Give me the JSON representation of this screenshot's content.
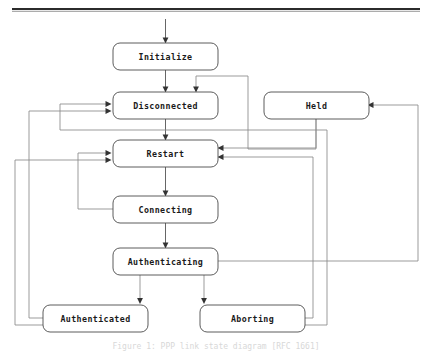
{
  "page": {
    "caption": "Figure 1: PPP link state diagram [RFC 1661]",
    "background_color": "#ffffff",
    "node_fill": "#ffffff",
    "node_stroke": "#4a4a4a",
    "edge_color": "#8a8a8a",
    "arrow_color": "#333333",
    "rule_color": "#2b2b2b"
  },
  "diagram": {
    "type": "state-machine",
    "orientation": "top-down",
    "entry_point": "Initialize",
    "states": [
      {
        "id": "initialize",
        "label": "Initialize",
        "x": 113,
        "y": 43,
        "w": 105,
        "h": 27
      },
      {
        "id": "disconnected",
        "label": "Disconnected",
        "x": 113,
        "y": 92,
        "w": 105,
        "h": 27
      },
      {
        "id": "held",
        "label": "Held",
        "x": 264,
        "y": 92,
        "w": 105,
        "h": 27
      },
      {
        "id": "restart",
        "label": "Restart",
        "x": 113,
        "y": 140,
        "w": 105,
        "h": 27
      },
      {
        "id": "connecting",
        "label": "Connecting",
        "x": 113,
        "y": 196,
        "w": 105,
        "h": 27
      },
      {
        "id": "authenticating",
        "label": "Authenticating",
        "x": 113,
        "y": 248,
        "w": 105,
        "h": 27
      },
      {
        "id": "authenticated",
        "label": "Authenticated",
        "x": 43,
        "y": 305,
        "w": 105,
        "h": 27
      },
      {
        "id": "aborting",
        "label": "Aborting",
        "x": 200,
        "y": 305,
        "w": 105,
        "h": 27
      }
    ],
    "transitions": [
      {
        "from": "start",
        "to": "initialize"
      },
      {
        "from": "initialize",
        "to": "disconnected"
      },
      {
        "from": "disconnected",
        "to": "restart"
      },
      {
        "from": "restart",
        "to": "connecting"
      },
      {
        "from": "connecting",
        "to": "authenticating"
      },
      {
        "from": "authenticating",
        "to": "authenticated"
      },
      {
        "from": "authenticating",
        "to": "aborting"
      },
      {
        "from": "authenticating",
        "to": "held"
      },
      {
        "from": "held",
        "to": "disconnected"
      },
      {
        "from": "held",
        "to": "restart"
      },
      {
        "from": "connecting",
        "to": "restart"
      },
      {
        "from": "authenticated",
        "to": "disconnected"
      },
      {
        "from": "authenticated",
        "to": "restart"
      },
      {
        "from": "aborting",
        "to": "disconnected"
      },
      {
        "from": "aborting",
        "to": "restart"
      }
    ]
  }
}
